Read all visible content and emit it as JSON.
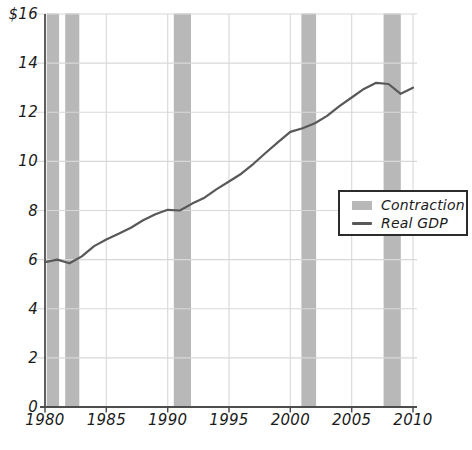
{
  "chart_data": {
    "type": "line",
    "title": "",
    "xlabel": "",
    "ylabel": "",
    "x": [
      1980,
      1981,
      1982,
      1983,
      1984,
      1985,
      1986,
      1987,
      1988,
      1989,
      1990,
      1991,
      1992,
      1993,
      1994,
      1995,
      1996,
      1997,
      1998,
      1999,
      2000,
      2001,
      2002,
      2003,
      2004,
      2005,
      2006,
      2007,
      2008,
      2009,
      2010
    ],
    "series": [
      {
        "name": "Real GDP",
        "values": [
          5.9,
          6.0,
          5.85,
          6.13,
          6.55,
          6.82,
          7.05,
          7.3,
          7.6,
          7.85,
          8.03,
          8.0,
          8.28,
          8.52,
          8.87,
          9.18,
          9.5,
          9.9,
          10.35,
          10.78,
          11.2,
          11.35,
          11.55,
          11.85,
          12.25,
          12.6,
          12.95,
          13.2,
          13.15,
          12.75,
          13.0
        ]
      }
    ],
    "bands": {
      "name": "Contraction",
      "ranges": [
        [
          1980.15,
          1981.15
        ],
        [
          1981.65,
          1982.8
        ],
        [
          1990.5,
          1991.9
        ],
        [
          2000.9,
          2002.1
        ],
        [
          2007.6,
          2009.0
        ]
      ]
    },
    "xlim": [
      1980,
      2010
    ],
    "ylim": [
      0,
      16
    ],
    "x_ticks": [
      1980,
      1985,
      1990,
      1995,
      2000,
      2005,
      2010
    ],
    "x_tick_labels": [
      "1980",
      "1985",
      "1990",
      "1995",
      "2000",
      "2005",
      "2010"
    ],
    "y_ticks": [
      0,
      2,
      4,
      6,
      8,
      10,
      12,
      14,
      16
    ],
    "y_tick_labels": [
      "0",
      "2",
      "4",
      "6",
      "8",
      "10",
      "12",
      "14",
      "$16"
    ],
    "grid": true,
    "legend": {
      "position": "right-middle",
      "items": [
        {
          "label": "Contraction",
          "swatch": "band"
        },
        {
          "label": "Real GDP",
          "swatch": "line"
        }
      ]
    },
    "colors": {
      "band": "#b8b8b8",
      "line": "#58585a",
      "grid": "#d8d8d8",
      "axis": "#4d4d4d",
      "text": "#1a1a1a",
      "legend_border": "#2b2b2b",
      "legend_bg": "#ffffff"
    }
  }
}
